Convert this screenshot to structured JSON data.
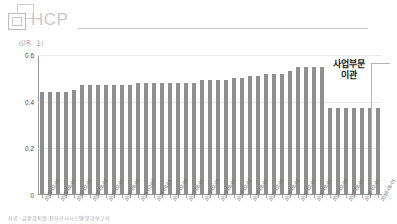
{
  "brand": {
    "logo_text": "HCP",
    "logo_icon": "overlapping-squares-icon"
  },
  "chart_header": {
    "unit_label": "(단위 : 조)"
  },
  "annotation": {
    "line1": "사업부문",
    "line2": "이관"
  },
  "footer": {
    "source_note": "자료 : 금융감독원 전자공시시스템 분기보고서"
  },
  "chart_data": {
    "type": "bar",
    "title": "",
    "subtitle": "",
    "xlabel": "",
    "ylabel": "",
    "unit": "조",
    "ylim": [
      0,
      0.6
    ],
    "yticks": [
      "0",
      "0.2",
      "0.4",
      "0.6"
    ],
    "ytick_values": [
      0,
      0.2,
      0.4,
      0.6
    ],
    "grid": true,
    "legend": "none",
    "bar_color": "#8f8f8f",
    "annotations": [
      {
        "text": "사업부문 이관",
        "position": "top-right",
        "note": "step-down in series after 2016"
      }
    ],
    "categories": [
      "2008-02-02",
      "2008-05-02",
      "2008-08-01",
      "2008-11-03",
      "2009-02-02",
      "2009-05-04",
      "2009-08-03",
      "2009-11-02",
      "2010-02-01",
      "2010-05-03",
      "2010-08-02",
      "2010-11-01",
      "2011-02-07",
      "2011-05-02",
      "2011-08-01",
      "2011-11-01",
      "2012-02-06",
      "2012-05-02",
      "2012-08-01",
      "2012-11-01",
      "2013-02-04",
      "2013-05-02",
      "2013-08-01",
      "2013-11-01",
      "2014-02-03",
      "2014-05-02",
      "2014-08-01",
      "2014-11-03",
      "2015-02-02",
      "2015-05-04",
      "2015-08-03",
      "2015-11-02",
      "2016-02-01",
      "2016-05-02",
      "2016-08-01",
      "2016-11-08",
      "2017-02-06",
      "2017-05-02",
      "2017-08-01",
      "2017-11-01",
      "2018-02-01",
      "2018-05-02",
      "2018-08-01"
    ],
    "values": [
      0.44,
      0.44,
      0.44,
      0.44,
      0.45,
      0.47,
      0.47,
      0.47,
      0.47,
      0.47,
      0.47,
      0.47,
      0.48,
      0.48,
      0.48,
      0.48,
      0.48,
      0.48,
      0.48,
      0.48,
      0.49,
      0.49,
      0.49,
      0.49,
      0.5,
      0.5,
      0.51,
      0.51,
      0.52,
      0.52,
      0.52,
      0.53,
      0.55,
      0.55,
      0.55,
      0.55,
      0.37,
      0.37,
      0.37,
      0.37,
      0.37,
      0.37,
      0.37
    ],
    "xtick_labels_shown": [
      "2008-02-02",
      "2009-01-01",
      "2009-08-03",
      "2010-05-03",
      "2010-08-02",
      "2011-02-07",
      "2011-08-01",
      "2012-02-06",
      "2012-08-01",
      "2013-02-04",
      "2013-05-02",
      "2013-08-01",
      "2014-02-03",
      "2014-08-01",
      "2015-02-02",
      "2015-08-03",
      "2016-02-01",
      "2016-08-01",
      "2016-11-08",
      "2017-05-02",
      "2018-05-02"
    ]
  }
}
